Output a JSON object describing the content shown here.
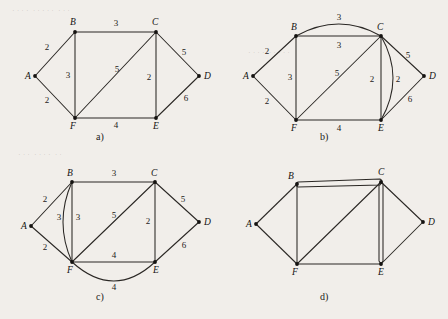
{
  "figure": {
    "background_color": "#f1eeea",
    "ink_color": "#2a2724"
  },
  "panels": [
    {
      "id": "a",
      "caption": "a)",
      "vertices": [
        {
          "id": "A",
          "label": "A",
          "x": 35,
          "y": 76
        },
        {
          "id": "B",
          "label": "B",
          "x": 75,
          "y": 32
        },
        {
          "id": "C",
          "label": "C",
          "x": 156,
          "y": 32
        },
        {
          "id": "D",
          "label": "D",
          "x": 199,
          "y": 76
        },
        {
          "id": "E",
          "label": "E",
          "x": 156,
          "y": 118
        },
        {
          "id": "F",
          "label": "F",
          "x": 75,
          "y": 118
        }
      ],
      "edges": [
        {
          "from": "A",
          "to": "B",
          "weight": "2",
          "shape": "straight",
          "label_x": 47,
          "label_y": 50
        },
        {
          "from": "A",
          "to": "F",
          "weight": "2",
          "shape": "straight",
          "label_x": 47,
          "label_y": 103
        },
        {
          "from": "B",
          "to": "C",
          "weight": "3",
          "shape": "straight",
          "label_x": 116,
          "label_y": 26
        },
        {
          "from": "B",
          "to": "F",
          "weight": "3",
          "shape": "straight",
          "label_x": 68,
          "label_y": 78
        },
        {
          "from": "C",
          "to": "F",
          "weight": "5",
          "shape": "straight",
          "label_x": 117,
          "label_y": 72
        },
        {
          "from": "C",
          "to": "D",
          "weight": "5",
          "shape": "straight",
          "label_x": 184,
          "label_y": 55
        },
        {
          "from": "C",
          "to": "E",
          "weight": "2",
          "shape": "straight",
          "label_x": 149,
          "label_y": 80
        },
        {
          "from": "D",
          "to": "E",
          "weight": "6",
          "shape": "straight",
          "label_x": 186,
          "label_y": 101
        },
        {
          "from": "F",
          "to": "E",
          "weight": "4",
          "shape": "straight",
          "label_x": 116,
          "label_y": 128
        }
      ]
    },
    {
      "id": "b",
      "caption": "b)",
      "vertices": [
        {
          "id": "A",
          "label": "A",
          "x": 29,
          "y": 76
        },
        {
          "id": "B",
          "label": "B",
          "x": 72,
          "y": 36
        },
        {
          "id": "C",
          "label": "C",
          "x": 157,
          "y": 36
        },
        {
          "id": "D",
          "label": "D",
          "x": 200,
          "y": 76
        },
        {
          "id": "E",
          "label": "E",
          "x": 157,
          "y": 120
        },
        {
          "id": "F",
          "label": "F",
          "x": 72,
          "y": 120
        }
      ],
      "edges": [
        {
          "from": "A",
          "to": "B",
          "weight": "2",
          "shape": "straight",
          "label_x": 43,
          "label_y": 54
        },
        {
          "from": "A",
          "to": "F",
          "weight": "2",
          "shape": "straight",
          "label_x": 43,
          "label_y": 104
        },
        {
          "from": "B",
          "to": "C",
          "weight": "3",
          "shape": "arc-up",
          "label_x": 115,
          "label_y": 20
        },
        {
          "from": "B",
          "to": "C",
          "weight": "3",
          "shape": "straight",
          "label_x": 115,
          "label_y": 48
        },
        {
          "from": "B",
          "to": "F",
          "weight": "3",
          "shape": "straight",
          "label_x": 66,
          "label_y": 80
        },
        {
          "from": "C",
          "to": "F",
          "weight": "5",
          "shape": "straight",
          "label_x": 113,
          "label_y": 76
        },
        {
          "from": "C",
          "to": "D",
          "weight": "5",
          "shape": "straight",
          "label_x": 184,
          "label_y": 58
        },
        {
          "from": "C",
          "to": "E",
          "weight": "2",
          "shape": "straight",
          "label_x": 148,
          "label_y": 82
        },
        {
          "from": "C",
          "to": "E",
          "weight": "2",
          "shape": "arc-right",
          "label_x": 174,
          "label_y": 82
        },
        {
          "from": "D",
          "to": "E",
          "weight": "6",
          "shape": "straight",
          "label_x": 186,
          "label_y": 102
        },
        {
          "from": "F",
          "to": "E",
          "weight": "4",
          "shape": "straight",
          "label_x": 115,
          "label_y": 131
        }
      ]
    },
    {
      "id": "c",
      "caption": "c)",
      "vertices": [
        {
          "id": "A",
          "label": "A",
          "x": 31,
          "y": 66
        },
        {
          "id": "B",
          "label": "B",
          "x": 72,
          "y": 22
        },
        {
          "id": "C",
          "label": "C",
          "x": 155,
          "y": 22
        },
        {
          "id": "D",
          "label": "D",
          "x": 199,
          "y": 62
        },
        {
          "id": "E",
          "label": "E",
          "x": 155,
          "y": 102
        },
        {
          "id": "F",
          "label": "F",
          "x": 72,
          "y": 102
        }
      ],
      "edges": [
        {
          "from": "A",
          "to": "B",
          "weight": "2",
          "shape": "straight",
          "label_x": 45,
          "label_y": 42
        },
        {
          "from": "A",
          "to": "F",
          "weight": "2",
          "shape": "straight",
          "label_x": 45,
          "label_y": 90
        },
        {
          "from": "B",
          "to": "C",
          "weight": "3",
          "shape": "straight",
          "label_x": 114,
          "label_y": 16
        },
        {
          "from": "B",
          "to": "F",
          "weight": "3",
          "shape": "arc-left",
          "label_x": 59,
          "label_y": 60
        },
        {
          "from": "B",
          "to": "F",
          "weight": "3",
          "shape": "straight",
          "label_x": 78,
          "label_y": 60
        },
        {
          "from": "C",
          "to": "F",
          "weight": "5",
          "shape": "straight",
          "label_x": 114,
          "label_y": 58
        },
        {
          "from": "C",
          "to": "D",
          "weight": "5",
          "shape": "straight",
          "label_x": 183,
          "label_y": 42
        },
        {
          "from": "C",
          "to": "E",
          "weight": "2",
          "shape": "straight",
          "label_x": 148,
          "label_y": 64
        },
        {
          "from": "D",
          "to": "E",
          "weight": "6",
          "shape": "straight",
          "label_x": 184,
          "label_y": 88
        },
        {
          "from": "F",
          "to": "E",
          "weight": "4",
          "shape": "straight",
          "label_x": 114,
          "label_y": 98
        },
        {
          "from": "F",
          "to": "E",
          "weight": "4",
          "shape": "arc-down",
          "label_x": 114,
          "label_y": 130
        }
      ]
    },
    {
      "id": "d",
      "caption": "d)",
      "vertices": [
        {
          "id": "A",
          "label": "A",
          "x": 32,
          "y": 64
        },
        {
          "id": "B",
          "label": "B",
          "x": 73,
          "y": 24
        },
        {
          "id": "C",
          "label": "C",
          "x": 157,
          "y": 22
        },
        {
          "id": "D",
          "label": "D",
          "x": 199,
          "y": 62
        },
        {
          "id": "E",
          "label": "E",
          "x": 157,
          "y": 104
        },
        {
          "id": "F",
          "label": "F",
          "x": 73,
          "y": 104
        }
      ],
      "edges": [
        {
          "from": "A",
          "to": "B",
          "weight": "",
          "shape": "straight",
          "label_x": 0,
          "label_y": 0
        },
        {
          "from": "A",
          "to": "F",
          "weight": "",
          "shape": "straight",
          "label_x": 0,
          "label_y": 0
        },
        {
          "from": "B",
          "to": "C",
          "weight": "",
          "shape": "double-loop-h",
          "label_x": 0,
          "label_y": 0
        },
        {
          "from": "B",
          "to": "F",
          "weight": "",
          "shape": "straight",
          "label_x": 0,
          "label_y": 0
        },
        {
          "from": "C",
          "to": "F",
          "weight": "",
          "shape": "straight",
          "label_x": 0,
          "label_y": 0
        },
        {
          "from": "C",
          "to": "D",
          "weight": "",
          "shape": "straight",
          "label_x": 0,
          "label_y": 0
        },
        {
          "from": "C",
          "to": "E",
          "weight": "",
          "shape": "double-loop-v",
          "label_x": 0,
          "label_y": 0
        },
        {
          "from": "D",
          "to": "E",
          "weight": "",
          "shape": "straight",
          "label_x": 0,
          "label_y": 0
        },
        {
          "from": "F",
          "to": "E",
          "weight": "",
          "shape": "straight",
          "label_x": 0,
          "label_y": 0
        }
      ]
    }
  ]
}
